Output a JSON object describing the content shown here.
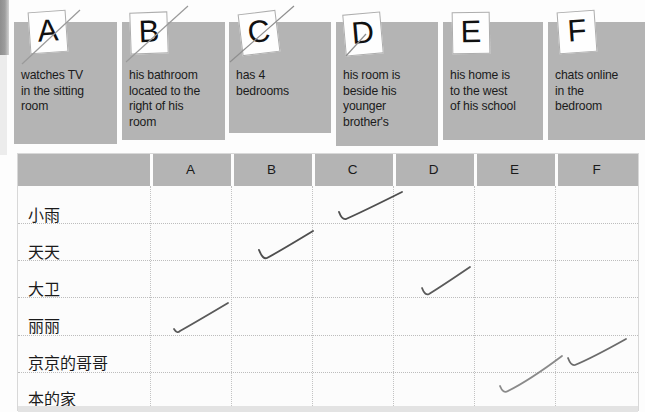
{
  "worksheet": {
    "clue_cards": [
      {
        "letter": "A",
        "text": "watches TV\nin the sitting\nroom"
      },
      {
        "letter": "B",
        "text": "his bathroom\nlocated to the\nright of his\nroom"
      },
      {
        "letter": "C",
        "text": "has 4\nbedrooms"
      },
      {
        "letter": "D",
        "text": "his room is\nbeside his\nyounger\nbrother's"
      },
      {
        "letter": "E",
        "text": "his home is\nto the west\nof his school"
      },
      {
        "letter": "F",
        "text": "chats online\nin the\nbedroom"
      }
    ],
    "table": {
      "corner_label": "",
      "columns": [
        "A",
        "B",
        "C",
        "D",
        "E",
        "F"
      ],
      "rows": [
        {
          "name": "小雨",
          "checked": "C"
        },
        {
          "name": "天天",
          "checked": "B"
        },
        {
          "name": "大卫",
          "checked": "D"
        },
        {
          "name": "丽丽",
          "checked": "A"
        },
        {
          "name": "京京的哥哥",
          "checked": "F"
        },
        {
          "name": "本的家",
          "checked": "E"
        }
      ]
    },
    "colors": {
      "card_fill": "#b4b4b4",
      "header_fill": "#b4b4b4",
      "pencil": "#5a5a5a",
      "page": "#fdfdfd"
    }
  }
}
